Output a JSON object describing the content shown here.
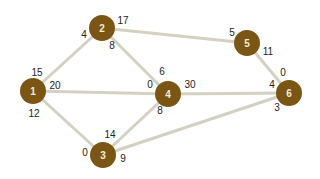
{
  "colors": {
    "node": "#7b5514",
    "node_label": "#f3ead8",
    "edge": "#d4d0c2",
    "weight_text": "#222222",
    "background": "#ffffff"
  },
  "nodes": [
    {
      "id": "1",
      "label": "1",
      "x": 33,
      "y": 91
    },
    {
      "id": "2",
      "label": "2",
      "x": 102,
      "y": 28
    },
    {
      "id": "3",
      "label": "3",
      "x": 103,
      "y": 155
    },
    {
      "id": "4",
      "label": "4",
      "x": 168,
      "y": 94
    },
    {
      "id": "5",
      "label": "5",
      "x": 247,
      "y": 43
    },
    {
      "id": "6",
      "label": "6",
      "x": 289,
      "y": 93
    }
  ],
  "edges": [
    {
      "from": "1",
      "to": "2"
    },
    {
      "from": "1",
      "to": "4"
    },
    {
      "from": "1",
      "to": "3"
    },
    {
      "from": "2",
      "to": "5"
    },
    {
      "from": "2",
      "to": "4"
    },
    {
      "from": "4",
      "to": "6"
    },
    {
      "from": "4",
      "to": "3"
    },
    {
      "from": "5",
      "to": "6"
    },
    {
      "from": "3",
      "to": "6"
    }
  ],
  "weights": [
    {
      "text": "15",
      "x": 37,
      "y": 72
    },
    {
      "text": "20",
      "x": 55,
      "y": 85
    },
    {
      "text": "12",
      "x": 34,
      "y": 113
    },
    {
      "text": "4",
      "x": 84,
      "y": 34
    },
    {
      "text": "17",
      "x": 123,
      "y": 20
    },
    {
      "text": "8",
      "x": 112,
      "y": 45
    },
    {
      "text": "6",
      "x": 162,
      "y": 71
    },
    {
      "text": "0",
      "x": 150,
      "y": 84
    },
    {
      "text": "30",
      "x": 190,
      "y": 84
    },
    {
      "text": "8",
      "x": 160,
      "y": 110
    },
    {
      "text": "5",
      "x": 232,
      "y": 32
    },
    {
      "text": "11",
      "x": 268,
      "y": 51
    },
    {
      "text": "0",
      "x": 283,
      "y": 72
    },
    {
      "text": "4",
      "x": 272,
      "y": 84
    },
    {
      "text": "3",
      "x": 277,
      "y": 107
    },
    {
      "text": "14",
      "x": 110,
      "y": 134
    },
    {
      "text": "0",
      "x": 85,
      "y": 152
    },
    {
      "text": "9",
      "x": 123,
      "y": 158
    }
  ]
}
